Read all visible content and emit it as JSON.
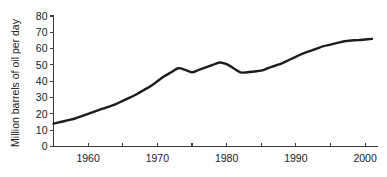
{
  "figure": {
    "background_color": "#ffffff",
    "line_color": "#1c1c1c",
    "axis_color": "#3a3a3a"
  },
  "chart_data": {
    "type": "line",
    "title": "",
    "subtitle": "",
    "xlabel": "",
    "ylabel": "Million barrels of oil per day",
    "xlim": [
      1955,
      2001
    ],
    "ylim": [
      0,
      80
    ],
    "grid": false,
    "legend": "none",
    "y_ticks": [
      0,
      10,
      20,
      30,
      40,
      50,
      60,
      70,
      80
    ],
    "y_tick_labels": [
      "0",
      "10",
      "20",
      "30",
      "40",
      "50",
      "60",
      "70",
      "80"
    ],
    "x_ticks": [
      1955,
      1960,
      1965,
      1970,
      1975,
      1980,
      1985,
      1990,
      1995,
      2000
    ],
    "x_tick_labels": [
      "",
      "1960",
      "",
      "1970",
      "",
      "1980",
      "",
      "1990",
      "",
      "2000"
    ],
    "x_labeled_ticks": [
      1960,
      1970,
      1980,
      1990,
      2000
    ],
    "series": [
      {
        "name": "World oil production",
        "x": [
          1955,
          1956,
          1957,
          1958,
          1959,
          1960,
          1961,
          1962,
          1963,
          1964,
          1965,
          1966,
          1967,
          1968,
          1969,
          1970,
          1971,
          1972,
          1973,
          1974,
          1975,
          1976,
          1977,
          1978,
          1979,
          1980,
          1981,
          1982,
          1983,
          1984,
          1985,
          1986,
          1987,
          1988,
          1989,
          1990,
          1991,
          1992,
          1993,
          1994,
          1995,
          1996,
          1997,
          1998,
          1999,
          2000,
          2001
        ],
        "values": [
          14,
          15,
          16,
          17,
          18.5,
          20,
          21.5,
          23,
          24.5,
          26,
          28,
          30,
          32,
          34.5,
          37,
          40,
          43,
          45.5,
          48,
          47,
          45.5,
          47,
          48.5,
          50,
          51.5,
          50.5,
          48,
          45.5,
          45.5,
          46,
          46.5,
          48,
          49.5,
          51,
          53,
          55,
          57,
          58.5,
          60,
          61.5,
          62.5,
          63.5,
          64.5,
          65,
          65.2,
          65.6,
          66
        ]
      }
    ]
  }
}
